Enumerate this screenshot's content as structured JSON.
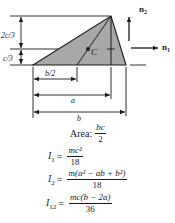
{
  "figure": {
    "shape": "triangle",
    "fill_color": "#a8a8a8",
    "stroke_color": "#1a1a1a",
    "labels": {
      "centroid": "C",
      "axis_n1": "n",
      "axis_n1_sub": "1",
      "axis_n2": "n",
      "axis_n2_sub": "2",
      "dim_upper_height": "2c/3",
      "dim_lower_height": "c/3",
      "dim_half_base": "b/2",
      "dim_apex_offset": "a",
      "dim_base": "b"
    }
  },
  "properties": {
    "area": {
      "label": "Area:",
      "numerator": "bc",
      "denominator": "2"
    },
    "I1": {
      "symbol": "I",
      "sub": "1",
      "equals": "=",
      "numerator": "mc²",
      "denominator": "18"
    },
    "I2": {
      "symbol": "I",
      "sub": "2",
      "equals": "=",
      "numerator": "m(a² − ab + b²)",
      "denominator": "18"
    },
    "I12": {
      "symbol": "I",
      "sub": "12",
      "equals": "=",
      "numerator": "mc(b − 2a)",
      "denominator": "36"
    }
  }
}
